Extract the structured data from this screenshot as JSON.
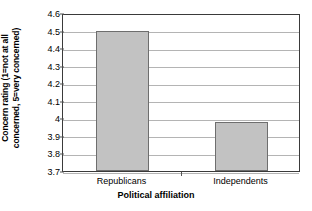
{
  "chart_data": {
    "type": "bar",
    "title": "",
    "xlabel": "Political affiliation",
    "ylabel": "Concern rating (1=not at all concerned, 5=very concerned)",
    "ylabel_line1": "Concern rating (1=not at all",
    "ylabel_line2": "concerned, 5=very concerned)",
    "categories": [
      "Republicans",
      "Independents"
    ],
    "values": [
      4.5,
      3.98
    ],
    "ylim": [
      3.7,
      4.6
    ],
    "ytick_labels": [
      "4.6",
      "4.5",
      "4.4",
      "4.3",
      "4.2",
      "4.1",
      "4",
      "3.9",
      "3.8",
      "3.7"
    ],
    "ytick_values": [
      4.6,
      4.5,
      4.4,
      4.3,
      4.2,
      4.1,
      4.0,
      3.9,
      3.8,
      3.7
    ],
    "grid": true,
    "legend": "none",
    "bar_color": "#c2c2c2",
    "bar_edge_color": "#6e6e6e",
    "gridline_color": "#b4b4b4",
    "axis_color": "#3a3a3a",
    "background": "#ffffff"
  }
}
